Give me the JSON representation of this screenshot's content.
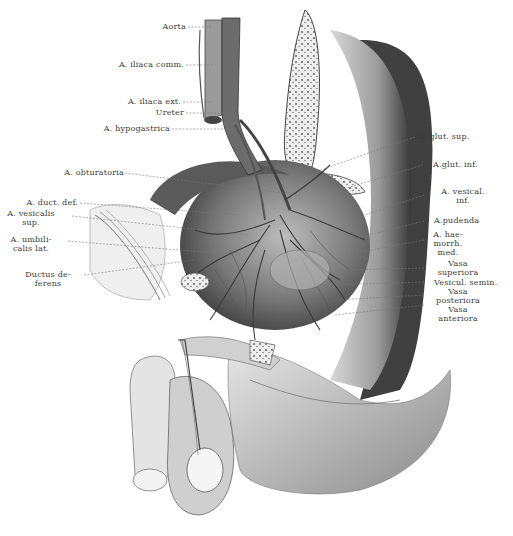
{
  "figure": {
    "type": "anatomical-illustration",
    "colors": {
      "ink": "#3a3a3a",
      "shade_dark": "#4a4a4a",
      "shade_mid": "#8c8c8c",
      "shade_light": "#cfcfcf",
      "bone": "#e6e6e6",
      "paper": "#ffffff"
    }
  },
  "labels": {
    "aorta": "Aorta",
    "iliaca_comm": "A. iliaca comm.",
    "iliaca_ext": "A. iliaca ext.",
    "ureter": "Ureter",
    "hypogastrica": "A. hypogastrica",
    "obturatoria": "A. obturatoria",
    "duct_def": "A. duct. def.",
    "vesicalis_sup": "A. vesicalis\nsup.",
    "umbilicalis_lat": "A. umbili-\ncalis lat.",
    "ductus_deferens": "Ductus de-\nferens",
    "glut_sup": "A. glut. sup.",
    "glut_inf": "A.glut. inf.",
    "vesical_inf": "A. vesical.\ninf.",
    "pudenda": "A.pudenda",
    "haemorrh_med": "A. hae-\nmorrh.\nmed.",
    "vasa_superiora": "Vasa\nsuperiora",
    "vesicul_semin": "Vesicul. semin.",
    "vasa_posteriora": "Vasa\nposteriora",
    "vasa_anteriora": "Vasa\nanteriora"
  }
}
